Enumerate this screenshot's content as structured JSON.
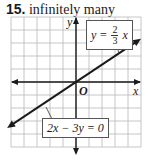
{
  "problem": {
    "number": "15.",
    "answer": "infinitely many"
  },
  "chart_data": {
    "type": "line",
    "title": "15. infinitely many",
    "xlabel": "x",
    "ylabel": "y",
    "origin_label": "O",
    "xlim": [
      -5,
      5
    ],
    "ylim": [
      -5,
      5
    ],
    "grid": true,
    "series": [
      {
        "name": "y = 2/3 x",
        "equation": "y = (2/3)x",
        "slope": 0.6667,
        "intercept": 0
      },
      {
        "name": "2x - 3y = 0",
        "equation": "2x − 3y = 0",
        "slope": 0.6667,
        "intercept": 0
      }
    ],
    "annotations": [
      {
        "text": "y = 2/3 x",
        "display": {
          "lhs": "y =",
          "num": "2",
          "den": "3",
          "var": "x"
        },
        "points_to": "upper-right line"
      },
      {
        "text": "2x − 3y = 0",
        "points_to": "lower-left line"
      }
    ]
  }
}
